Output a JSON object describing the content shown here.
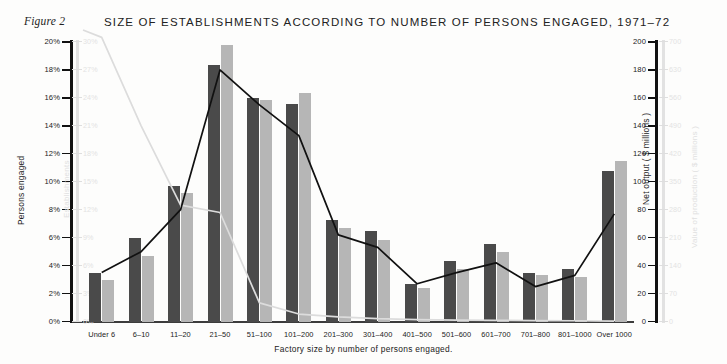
{
  "figure_label": "Figure 2",
  "title": "SIZE OF ESTABLISHMENTS ACCORDING TO NUMBER OF PERSONS ENGAGED, 1971–72",
  "axis_titles": {
    "y_left": "Persons engaged",
    "y_left_secondary": "Establishments",
    "y_right": "Net output ( $ millions )",
    "y_right_secondary": "Value of production ( $ millions )",
    "x": "Factory size by number of persons engaged."
  },
  "colors": {
    "bar_dark": "#4a4a4a",
    "bar_light": "#b6b6b6",
    "line_dark": "#111111",
    "line_light": "#dcdcdc",
    "axis": "#111111",
    "axis_faint": "#e2e2e2",
    "background": "#fdfdfc"
  },
  "chart_data": {
    "type": "bar",
    "title": "SIZE OF ESTABLISHMENTS ACCORDING TO NUMBER OF PERSONS ENGAGED, 1971–72",
    "xlabel": "Factory size by number of persons engaged.",
    "ylabel": "Persons engaged",
    "grid": false,
    "legend": "none",
    "categories": [
      "Under 6",
      "6–10",
      "11–20",
      "21–50",
      "51–100",
      "101–200",
      "201–300",
      "301–400",
      "401–500",
      "501–600",
      "601–700",
      "701–800",
      "801–1000",
      "Over 1000"
    ],
    "axes": {
      "y_left_primary": {
        "label": "Persons engaged",
        "range": [
          0,
          20
        ],
        "unit": "%",
        "ticks": [
          "0%",
          "2%",
          "4%",
          "6%",
          "8%",
          "10%",
          "12%",
          "14%",
          "16%",
          "18%",
          "20%"
        ],
        "tick_values": [
          0,
          2,
          4,
          6,
          8,
          10,
          12,
          14,
          16,
          18,
          20
        ]
      },
      "y_left_secondary": {
        "label": "Establishments",
        "range": [
          0,
          30
        ],
        "unit": "%",
        "ticks": [
          "0%",
          "3%",
          "6%",
          "9%",
          "12%",
          "15%",
          "18%",
          "21%",
          "24%",
          "27%",
          "30%"
        ],
        "tick_values": [
          0,
          3,
          6,
          9,
          12,
          15,
          18,
          21,
          24,
          27,
          30
        ]
      },
      "y_right_primary": {
        "label": "Net output ( $ millions )",
        "range": [
          0,
          200
        ],
        "ticks": [
          "0",
          "20",
          "40",
          "60",
          "80",
          "100",
          "120",
          "140",
          "160",
          "180",
          "200"
        ],
        "tick_values": [
          0,
          20,
          40,
          60,
          80,
          100,
          120,
          140,
          160,
          180,
          200
        ]
      },
      "y_right_secondary": {
        "label": "Value of production ( $ millions )",
        "range": [
          0,
          700
        ],
        "ticks": [
          "0",
          "70",
          "140",
          "210",
          "280",
          "350",
          "420",
          "490",
          "560",
          "630",
          "700"
        ],
        "tick_values": [
          0,
          70,
          140,
          210,
          280,
          350,
          420,
          490,
          560,
          630,
          700
        ]
      }
    },
    "series": [
      {
        "name": "Persons engaged",
        "render": "bar-dark",
        "axis": "y_left_primary",
        "unit": "%",
        "values": [
          3.5,
          6.0,
          9.7,
          18.4,
          16.0,
          15.6,
          7.3,
          6.5,
          2.7,
          4.4,
          5.6,
          3.5,
          3.8,
          10.8
        ]
      },
      {
        "name": "Value of production",
        "render": "bar-light",
        "axis": "y_right_secondary",
        "unit": "$ millions",
        "values_pct_scale": [
          3.0,
          4.7,
          9.2,
          19.8,
          15.9,
          16.4,
          6.7,
          5.9,
          2.4,
          3.8,
          5.0,
          3.4,
          3.2,
          11.5
        ],
        "values": [
          105,
          165,
          322,
          693,
          557,
          574,
          235,
          207,
          84,
          133,
          175,
          119,
          112,
          403
        ]
      },
      {
        "name": "Net output",
        "render": "line-dark",
        "axis": "y_right_primary",
        "unit": "$ millions",
        "values": [
          35,
          50,
          80,
          180,
          155,
          133,
          62,
          53,
          27,
          35,
          42,
          25,
          33,
          77
        ]
      },
      {
        "name": "Establishments",
        "render": "line-light",
        "axis": "y_left_secondary",
        "unit": "%",
        "values": [
          30.5,
          21.0,
          12.5,
          11.7,
          2.0,
          0.8,
          0.5,
          0.3,
          0.2,
          0.15,
          0.12,
          0.1,
          0.08,
          0.05
        ]
      }
    ]
  }
}
